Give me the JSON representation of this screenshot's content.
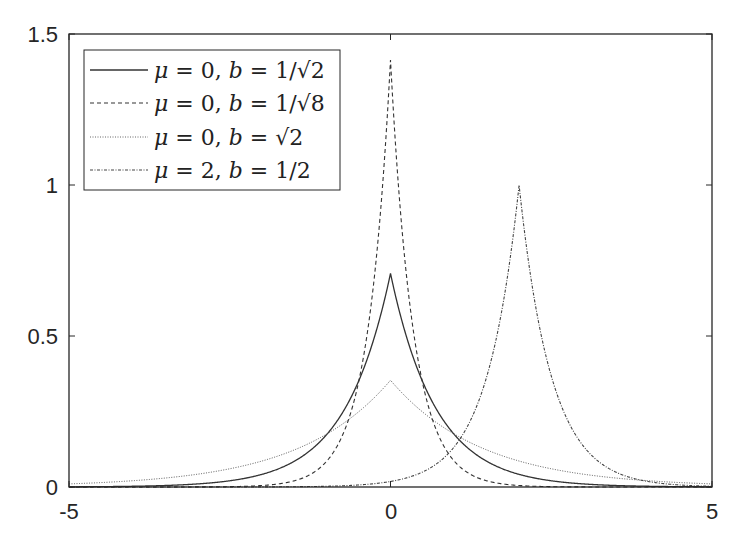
{
  "chart_data": {
    "type": "line",
    "title": "",
    "xlabel": "",
    "ylabel": "",
    "xlim": [
      -5,
      5
    ],
    "ylim": [
      0,
      1.5
    ],
    "grid": false,
    "legend_position": "upper-left",
    "x_ticks": [
      -5,
      0,
      5
    ],
    "x_tick_labels": [
      "-5",
      "0",
      "5"
    ],
    "y_ticks": [
      0,
      0.5,
      1,
      1.5
    ],
    "y_tick_labels": [
      "0",
      "0.5",
      "1",
      "1.5"
    ],
    "function": "Laplace PDF f(x) = 1/(2b) * exp(-|x - mu| / b)",
    "series": [
      {
        "name": "μ = 0, b = 1/√2",
        "mu": 0,
        "b": 0.70710678,
        "style": "solid",
        "color": "#333333",
        "peak": 0.7071
      },
      {
        "name": "μ = 0, b = 1/√8",
        "mu": 0,
        "b": 0.35355339,
        "style": "dashed",
        "color": "#333333",
        "peak": 1.4142
      },
      {
        "name": "μ = 0, b = √2",
        "mu": 0,
        "b": 1.41421356,
        "style": "dotted",
        "color": "#555555",
        "peak": 0.3536
      },
      {
        "name": "μ = 2, b = 1/2",
        "mu": 2,
        "b": 0.5,
        "style": "dashdot",
        "color": "#444444",
        "peak": 1.0
      }
    ]
  },
  "legend": {
    "entries": [
      {
        "mu": "0",
        "b": "1/√2"
      },
      {
        "mu": "0",
        "b": "1/√8"
      },
      {
        "mu": "0",
        "b": "√2"
      },
      {
        "mu": "2",
        "b": "1/2"
      }
    ]
  },
  "axes": {
    "x_tick_labels": [
      "-5",
      "0",
      "5"
    ],
    "y_tick_labels": [
      "0",
      "0.5",
      "1",
      "1.5"
    ]
  }
}
